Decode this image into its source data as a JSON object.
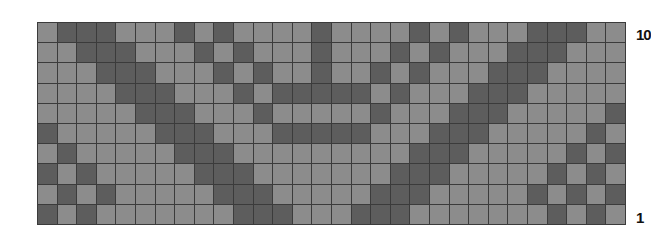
{
  "chart": {
    "type": "knitting-colorwork-chart",
    "columns": 30,
    "rows": 10,
    "colors": {
      "light": "#8c8c8c",
      "dark": "#5d5d5d",
      "grid": "#3b3b3b"
    },
    "row_labels": {
      "top": "10",
      "bottom": "1"
    },
    "pattern_top_to_bottom": [
      "LDDDLLLDLDLLLLDLLLLDLDLLLDDDLL",
      "LLDDDLLLDLDLLLDLLLDLDLLLDDDLLL",
      "LLLDDDLLLDLDLLDLLDLDLLLDDDLLLL",
      "LLLLDDDLLLDLDDDDDLDLLLDDDLLLLL",
      "LLLLLDDDLLLDLLLLLDLLLDDDLLLLLD",
      "DLLLLLDDDLLLDDDDDLLLDDDLLLLLDL",
      "LDLLLLLDDDLLLLLLLLLDDDLLLLLDLD",
      "DLDLLLLLDDDLLLLLLLDDDLLLLLDLDL",
      "LDLDLLLLLDDDLLLLLDDDLLLLLDLDLD",
      "DLDLLLLLLLDDDLLLDDDLLLLLLLDLDL"
    ]
  }
}
